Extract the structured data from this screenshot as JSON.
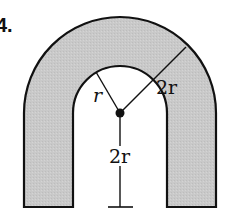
{
  "problem_number": "4.",
  "labels": {
    "inner_radius": "r",
    "outer_radius": "2r",
    "height": "2r"
  },
  "colors": {
    "fill": "#c8c8c8",
    "stroke": "#111111",
    "background": "#ffffff"
  }
}
